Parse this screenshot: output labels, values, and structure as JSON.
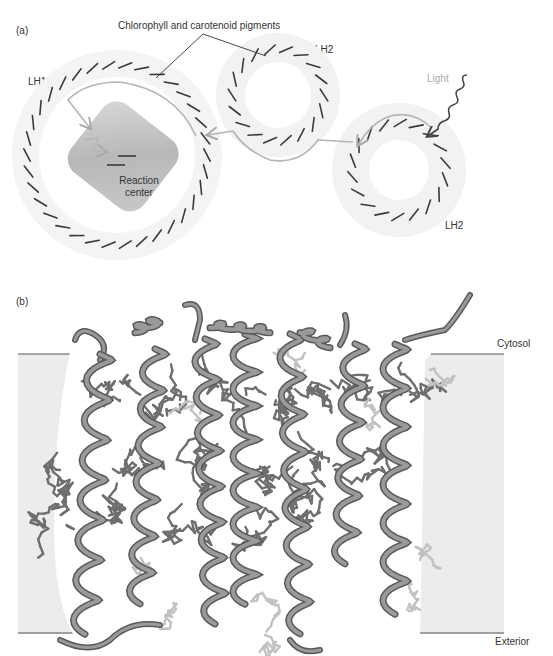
{
  "panel_a": {
    "label": "(a)",
    "pigments_label": "Chlorophyll and carotenoid pigments",
    "lh1_label": "LH1",
    "lh2_top_label": "LH2",
    "lh2_bottom_label": "LH2",
    "light_label": "Light",
    "reaction_center_line1": "Reaction",
    "reaction_center_line2": "center",
    "colors": {
      "ring": "#efefef",
      "pigment": "#3a3a3a",
      "energy_arrow": "#b5b5b5",
      "light_wave": "#4a4a4a",
      "reaction_center": "#bdbdbd"
    }
  },
  "panel_b": {
    "label": "(b)",
    "cytosol_label": "Cytosol",
    "exterior_label": "Exterior",
    "colors": {
      "membrane": "#ececec",
      "helix": "#8a8a8a",
      "helix_dark": "#5a5a5a",
      "pigment_light": "#c4c4c4"
    }
  }
}
